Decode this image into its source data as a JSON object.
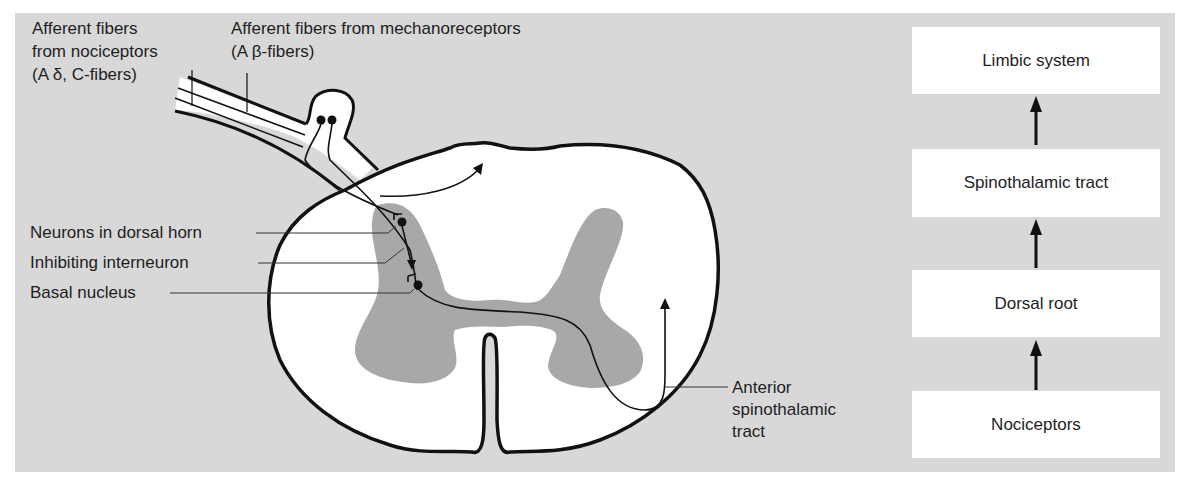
{
  "colors": {
    "background": "#d8d8d8",
    "gray_matter": "#a8a8a8",
    "white_matter": "#ffffff",
    "stroke": "#111111"
  },
  "labels": {
    "nociceptor_fibers": [
      "Afferent fibers",
      "from nociceptors",
      "(A δ, C-fibers)"
    ],
    "mechanoreceptor_fibers": [
      "Afferent fibers from mechanoreceptors",
      "(A β-fibers)"
    ],
    "dorsal_horn_neurons": "Neurons in dorsal horn",
    "inhibiting_interneuron": "Inhibiting interneuron",
    "basal_nucleus": "Basal nucleus",
    "anterior_tract": [
      "Anterior",
      "spinothalamic",
      "tract"
    ]
  },
  "flow": {
    "boxes": [
      {
        "label": "Limbic system"
      },
      {
        "label": "Spinothalamic tract"
      },
      {
        "label": "Dorsal root"
      },
      {
        "label": "Nociceptors"
      }
    ],
    "arrow_icon": "up-arrow-icon"
  }
}
